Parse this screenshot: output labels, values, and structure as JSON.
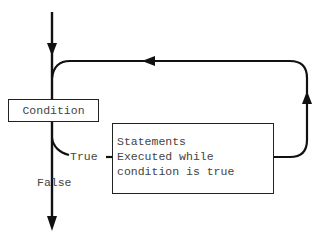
{
  "diagram": {
    "type": "while-loop-flowchart",
    "condition_label": "Condition",
    "statements_lines": [
      "Statements",
      "Executed while",
      "condition is true"
    ],
    "true_label": "True",
    "false_label": "False",
    "line_color": "#111111",
    "text_color": "#444444"
  }
}
